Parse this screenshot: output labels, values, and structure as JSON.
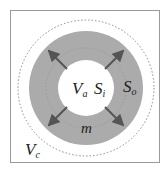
{
  "diagram": {
    "type": "concentric-circles",
    "colors": {
      "background": "#ffffff",
      "frame": "#9a9a9a",
      "shell": "#ababab",
      "inner_core": "#ffffff",
      "arrow": "#555555",
      "dashed": "#8a8a8a",
      "text": "#222222"
    },
    "labels": {
      "inner_volume": {
        "main": "V",
        "sub": "a"
      },
      "inner_surface": {
        "main": "S",
        "sub": "i"
      },
      "outer_surface": {
        "main": "S",
        "sub": "o"
      },
      "mass": {
        "main": "m"
      },
      "control_volume": {
        "main": "V",
        "sub": "c"
      }
    },
    "arrows": {
      "count": 4,
      "directions": [
        "up-left",
        "up-right",
        "down-left",
        "down-right"
      ],
      "meaning": "outward radial expansion"
    }
  }
}
